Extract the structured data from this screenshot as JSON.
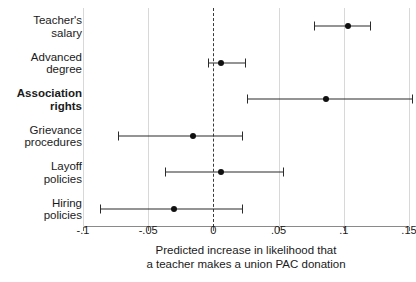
{
  "chart_data": {
    "type": "scatter",
    "orientation": "horizontal",
    "title": "",
    "xlabel": "Predicted increase in likelihood that\na teacher makes a union PAC donation",
    "ylabel": "",
    "xlim": [
      -0.1,
      0.15
    ],
    "xticks": [
      -0.1,
      -0.05,
      0,
      0.05,
      0.1,
      0.15
    ],
    "xticklabels": [
      "-.1",
      "-.05",
      "0",
      ".05",
      ".1",
      ".15"
    ],
    "grid": "vertical-at-xticks",
    "reference_line": {
      "value": 0,
      "style": "dashed"
    },
    "legend": null,
    "categories": [
      "Teacher's\nsalary",
      "Advanced\ndegree",
      "Association\nrights",
      "Grievance\nprocedures",
      "Layoff\npolicies",
      "Hiring\npolicies"
    ],
    "emphasized_categories": [
      "Association\nrights"
    ],
    "points": [
      {
        "label": "Teacher's salary",
        "estimate": 0.103,
        "ci_low": 0.077,
        "ci_high": 0.12
      },
      {
        "label": "Advanced degree",
        "estimate": 0.006,
        "ci_low": -0.004,
        "ci_high": 0.024
      },
      {
        "label": "Association rights",
        "estimate": 0.086,
        "ci_low": 0.026,
        "ci_high": 0.152
      },
      {
        "label": "Grievance procedures",
        "estimate": -0.016,
        "ci_low": -0.073,
        "ci_high": 0.022
      },
      {
        "label": "Layoff policies",
        "estimate": 0.006,
        "ci_low": -0.037,
        "ci_high": 0.053
      },
      {
        "label": "Hiring policies",
        "estimate": -0.03,
        "ci_low": -0.087,
        "ci_high": 0.022
      }
    ]
  },
  "colors": {
    "marker": "#101010",
    "ci_line": "#2b2b2b",
    "gridline": "#d8d8d8",
    "axis": "#8a8a8a",
    "text": "#1a1a1a",
    "background": "#ffffff"
  }
}
